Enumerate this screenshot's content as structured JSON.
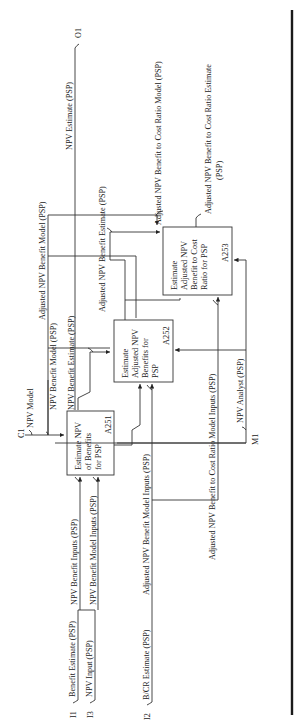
{
  "diagram": {
    "type": "IDEF0 activity decomposition",
    "orientation": "rotated 90 degrees counter-clockwise",
    "activities": [
      {
        "id": "A251",
        "lines": [
          "Estimate NPV",
          "of Benefits",
          "for PSP"
        ],
        "label": "A251"
      },
      {
        "id": "A252",
        "lines": [
          "Estimate",
          "Adjusted NPV",
          "Benefits for",
          "PSP"
        ],
        "label": "A252"
      },
      {
        "id": "A253",
        "lines": [
          "Estimate",
          "Adjusted NPV",
          "Benefit to Cost",
          "Ratio for PSP"
        ],
        "label": "A253"
      }
    ],
    "boundary": {
      "inputs": [
        {
          "code": "I1",
          "label": "Benefit Estimate (PSP)"
        },
        {
          "code": "I3",
          "label": "NPV Input (PSP)"
        },
        {
          "code": "I2",
          "label": "B/CR Estimate (PSP)"
        }
      ],
      "controls": [
        {
          "code": "C1",
          "label": "NPV Model"
        }
      ],
      "mechanisms": [
        {
          "code": "M1",
          "label": "NPV Analyst (PSP)"
        }
      ],
      "outputs": [
        {
          "code": "O1",
          "label": "NPV Estimate (PSP)"
        }
      ]
    },
    "flows": {
      "npv_benefit_inputs": "NPV Benefit Inputs (PSP)",
      "npv_benefit_model_inputs": "NPV Benefit Model Inputs (PSP)",
      "npv_benefit_model": "NPV Benefit Model (PSP)",
      "npv_benefit_estimate": "NPV Benefit Estimate (PSP)",
      "adj_npv_benefit_model_inputs": "Adjusted NPV Benefit Model Inputs (PSP)",
      "adj_npv_benefit_model": "Adjusted NPV Benefit Model (PSP)",
      "adj_npv_benefit_estimate": "Adjusted NPV Benefit Estimate (PSP)",
      "adj_npv_bcr_model_inputs": "Adjusted NPV Benefit to Cost Ratio Model Inputs (PSP)",
      "adj_npv_bcr_model": "Adjusted NPV Benefit to Cost Ratio Model (PSP)",
      "adj_npv_bcr_estimate_line1": "Adjusted NPV Benefit to Cost Ratio Estimate",
      "adj_npv_bcr_estimate_line2": "(PSP)"
    }
  }
}
